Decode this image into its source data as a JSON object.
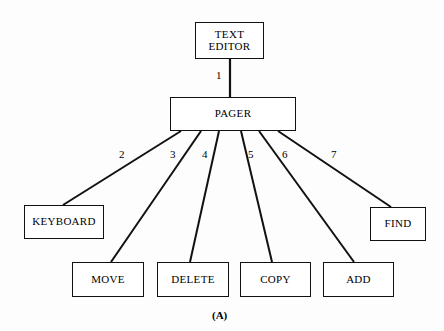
{
  "figure": {
    "caption": "(A)",
    "caption_x": 212,
    "caption_y": 309,
    "background": "#fdfdfd",
    "line_color": "#111111",
    "text_color": "#000000"
  },
  "nodes": [
    {
      "id": "text-editor",
      "label": "TEXT\nEDITOR",
      "x": 195,
      "y": 22,
      "w": 69,
      "h": 37,
      "font_size": 11
    },
    {
      "id": "pager",
      "label": "PAGER",
      "x": 170,
      "y": 97,
      "w": 126,
      "h": 34,
      "font_size": 11
    },
    {
      "id": "keyboard",
      "label": "KEYBOARD",
      "x": 24,
      "y": 205,
      "w": 80,
      "h": 34,
      "font_size": 11
    },
    {
      "id": "find",
      "label": "FIND",
      "x": 370,
      "y": 207,
      "w": 56,
      "h": 34,
      "font_size": 11
    },
    {
      "id": "move",
      "label": "MOVE",
      "x": 72,
      "y": 262,
      "w": 72,
      "h": 35,
      "font_size": 11
    },
    {
      "id": "delete",
      "label": "DELETE",
      "x": 157,
      "y": 262,
      "w": 72,
      "h": 35,
      "font_size": 11
    },
    {
      "id": "copy",
      "label": "COPY",
      "x": 240,
      "y": 262,
      "w": 71,
      "h": 35,
      "font_size": 11
    },
    {
      "id": "add",
      "label": "ADD",
      "x": 323,
      "y": 262,
      "w": 71,
      "h": 35,
      "font_size": 11
    }
  ],
  "edges": [
    {
      "id": "edge-1",
      "label": "1",
      "from": "pager",
      "to": "text-editor",
      "x1": 230,
      "y1": 97,
      "x2": 230,
      "y2": 59,
      "label_x": 216,
      "label_y": 69
    },
    {
      "id": "edge-2",
      "label": "2",
      "from": "pager",
      "to": "keyboard",
      "x1": 181,
      "y1": 131,
      "x2": 63,
      "y2": 205,
      "label_x": 119,
      "label_y": 148
    },
    {
      "id": "edge-3",
      "label": "3",
      "from": "pager",
      "to": "move",
      "x1": 201,
      "y1": 131,
      "x2": 111,
      "y2": 262,
      "label_x": 170,
      "label_y": 148
    },
    {
      "id": "edge-4",
      "label": "4",
      "from": "pager",
      "to": "delete",
      "x1": 219,
      "y1": 131,
      "x2": 190,
      "y2": 262,
      "label_x": 202,
      "label_y": 148
    },
    {
      "id": "edge-5",
      "label": "5",
      "from": "pager",
      "to": "copy",
      "x1": 241,
      "y1": 131,
      "x2": 272,
      "y2": 262,
      "label_x": 248,
      "label_y": 148
    },
    {
      "id": "edge-6",
      "label": "6",
      "from": "pager",
      "to": "add",
      "x1": 259,
      "y1": 131,
      "x2": 354,
      "y2": 262,
      "label_x": 282,
      "label_y": 148
    },
    {
      "id": "edge-7",
      "label": "7",
      "from": "pager",
      "to": "find",
      "x1": 278,
      "y1": 131,
      "x2": 391,
      "y2": 207,
      "label_x": 331,
      "label_y": 148
    }
  ],
  "chart_data": {
    "type": "diagram",
    "title": "(A)",
    "structure": "tree",
    "root": "TEXT EDITOR",
    "levels": [
      [
        "TEXT EDITOR"
      ],
      [
        "PAGER"
      ],
      [
        "KEYBOARD",
        "MOVE",
        "DELETE",
        "COPY",
        "ADD",
        "FIND"
      ]
    ],
    "connections": [
      {
        "number": 1,
        "from": "TEXT EDITOR",
        "to": "PAGER"
      },
      {
        "number": 2,
        "from": "PAGER",
        "to": "KEYBOARD"
      },
      {
        "number": 3,
        "from": "PAGER",
        "to": "MOVE"
      },
      {
        "number": 4,
        "from": "PAGER",
        "to": "DELETE"
      },
      {
        "number": 5,
        "from": "PAGER",
        "to": "COPY"
      },
      {
        "number": 6,
        "from": "PAGER",
        "to": "ADD"
      },
      {
        "number": 7,
        "from": "PAGER",
        "to": "FIND"
      }
    ]
  }
}
